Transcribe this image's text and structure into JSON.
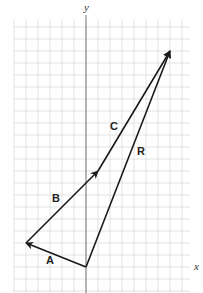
{
  "diagram": {
    "type": "vector-addition",
    "axes": {
      "x_label": "x",
      "y_label": "y"
    },
    "grid": {
      "spacing_px": 12,
      "origin_px": [
        86,
        267
      ],
      "color": "#dcdcdc"
    },
    "vectors": [
      {
        "name": "A",
        "label": "A",
        "from": [
          0,
          0
        ],
        "to": [
          -5,
          2
        ]
      },
      {
        "name": "B",
        "label": "B",
        "from": [
          -5,
          2
        ],
        "to": [
          1,
          8
        ]
      },
      {
        "name": "C",
        "label": "C",
        "from": [
          1,
          8
        ],
        "to": [
          7,
          18
        ]
      },
      {
        "name": "R",
        "label": "R",
        "from": [
          0,
          0
        ],
        "to": [
          7,
          18
        ]
      }
    ],
    "colors": {
      "vector": "#1a1a1a",
      "axis": "#888888",
      "x_axis_ends": "#d06080",
      "x_axis_mid": "#9fd0a8"
    }
  }
}
